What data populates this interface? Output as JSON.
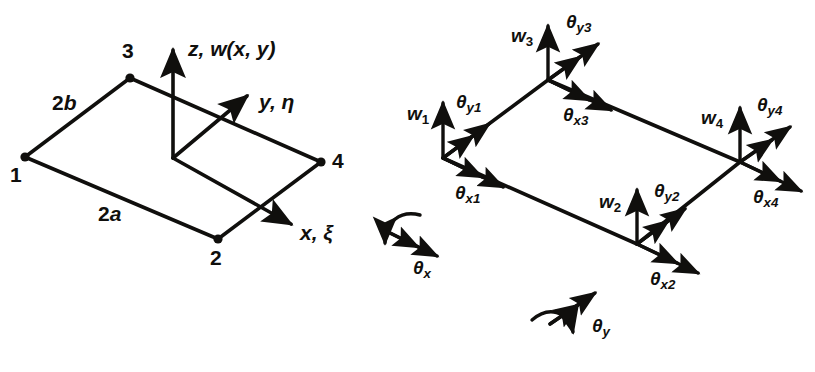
{
  "figure": {
    "ink_color": "#100f0d",
    "background_color": "#ffffff"
  },
  "left_diagram": {
    "name": "plate-geometry",
    "nodes": [
      {
        "id": "1",
        "label": "1",
        "x": 25,
        "y": 157
      },
      {
        "id": "2",
        "label": "2",
        "x": 218,
        "y": 239
      },
      {
        "id": "3",
        "label": "3",
        "x": 130,
        "y": 78
      },
      {
        "id": "4",
        "label": "4",
        "x": 321,
        "y": 162
      }
    ],
    "dimensions": [
      {
        "label": "2b",
        "letter": "2",
        "italic": "b"
      },
      {
        "label": "2a",
        "letter": "2",
        "italic": "a"
      }
    ],
    "axes": [
      {
        "name": "z-axis",
        "label": "z, w(x, y)",
        "symbol": "z",
        "rest": ", w(x, y)"
      },
      {
        "name": "y-axis",
        "label": "y, η",
        "symbol": "y",
        "rest": ", η"
      },
      {
        "name": "x-axis",
        "label": "x, ξ",
        "symbol": "x",
        "rest": ", ξ"
      }
    ]
  },
  "right_diagram": {
    "name": "nodal-degrees-of-freedom",
    "nodes": [
      {
        "id": "1",
        "x": 443,
        "y": 158,
        "dofs": [
          {
            "name": "w1",
            "base": "w",
            "sub": "1",
            "kind": "translation"
          },
          {
            "name": "theta-y1",
            "base": "θ",
            "sub": "y1",
            "kind": "rotation"
          },
          {
            "name": "theta-x1",
            "base": "θ",
            "sub": "x1",
            "kind": "rotation"
          }
        ]
      },
      {
        "id": "2",
        "x": 637,
        "y": 244,
        "dofs": [
          {
            "name": "w2",
            "base": "w",
            "sub": "2",
            "kind": "translation"
          },
          {
            "name": "theta-y2",
            "base": "θ",
            "sub": "y2",
            "kind": "rotation"
          },
          {
            "name": "theta-x2",
            "base": "θ",
            "sub": "x2",
            "kind": "rotation"
          }
        ]
      },
      {
        "id": "3",
        "x": 548,
        "y": 80,
        "dofs": [
          {
            "name": "w3",
            "base": "w",
            "sub": "3",
            "kind": "translation"
          },
          {
            "name": "theta-y3",
            "base": "θ",
            "sub": "y3",
            "kind": "rotation"
          },
          {
            "name": "theta-x3",
            "base": "θ",
            "sub": "x3",
            "kind": "rotation"
          }
        ]
      },
      {
        "id": "4",
        "x": 740,
        "y": 162,
        "dofs": [
          {
            "name": "w4",
            "base": "w",
            "sub": "4",
            "kind": "translation"
          },
          {
            "name": "theta-y4",
            "base": "θ",
            "sub": "y4",
            "kind": "rotation"
          },
          {
            "name": "theta-x4",
            "base": "θ",
            "sub": "x4",
            "kind": "rotation"
          }
        ]
      }
    ]
  },
  "rotation_conventions": [
    {
      "name": "theta-x-convention",
      "base": "θ",
      "sub": "x",
      "label": "θx"
    },
    {
      "name": "theta-y-convention",
      "base": "θ",
      "sub": "y",
      "label": "θy"
    }
  ],
  "labels": {
    "node1": "1",
    "node2": "2",
    "node3": "3",
    "node4": "4",
    "dim_2b_num": "2",
    "dim_2b_var": "b",
    "dim_2a_num": "2",
    "dim_2a_var": "a",
    "axis_z_sym": "z",
    "axis_z_rest": ", w(x, y)",
    "axis_y_sym": "y",
    "axis_y_rest": ", η",
    "axis_x_sym": "x",
    "axis_x_rest": ", ξ",
    "w_base": "w",
    "theta_base": "θ",
    "s1": "1",
    "s2": "2",
    "s3": "3",
    "s4": "4",
    "sx1": "x1",
    "sx2": "x2",
    "sx3": "x3",
    "sx4": "x4",
    "sy1": "y1",
    "sy2": "y2",
    "sy3": "y3",
    "sy4": "y4",
    "sx": "x",
    "sy": "y"
  }
}
